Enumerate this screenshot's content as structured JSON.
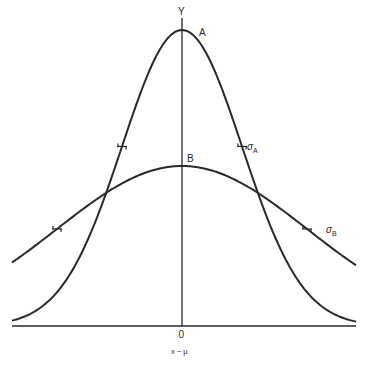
{
  "diagram": {
    "axis_labels": {
      "y": "Y",
      "origin": "0",
      "x": "x − μ"
    },
    "curves": [
      {
        "id": "A",
        "label": "A",
        "sigma_label": "σ",
        "sigma_subscript": "A",
        "description": "tall narrow normal curve",
        "center_px": 182,
        "baseline_px": 326,
        "peak_px": 30,
        "sigma_px": 60
      },
      {
        "id": "B",
        "label": "B",
        "sigma_label": "σ",
        "sigma_subscript": "B",
        "description": "low wide normal curve",
        "center_px": 182,
        "baseline_px": 326,
        "peak_px": 166,
        "sigma_px": 125
      }
    ],
    "colors": {
      "line": "#2a2a2a",
      "background": "#ffffff"
    }
  }
}
